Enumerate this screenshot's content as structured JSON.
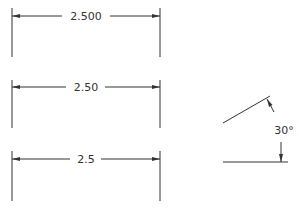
{
  "dimensions": [
    {
      "label": "2.500",
      "y": 16,
      "ext_top": 8,
      "ext_bottom": 57,
      "x1": 12,
      "x2": 160,
      "text_x": 86
    },
    {
      "label": "2.50",
      "y": 87,
      "ext_top": 80,
      "ext_bottom": 128,
      "x1": 12,
      "x2": 160,
      "text_x": 86
    },
    {
      "label": "2.5",
      "y": 159,
      "ext_top": 151,
      "ext_bottom": 201,
      "x1": 12,
      "x2": 160,
      "text_x": 86
    }
  ],
  "angle": {
    "label": "30°"
  },
  "colors": {
    "line": "#333333",
    "text": "#333333",
    "background": "#ffffff"
  }
}
